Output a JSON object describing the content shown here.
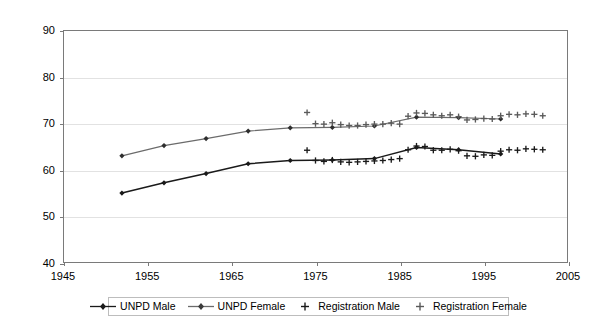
{
  "chart_data": {
    "type": "line",
    "title": "",
    "subtitle": "",
    "xlabel": "",
    "ylabel": "",
    "xlim": [
      1945,
      2005
    ],
    "ylim": [
      40,
      90
    ],
    "xticks": [
      1945,
      1955,
      1965,
      1975,
      1985,
      1995,
      2005
    ],
    "yticks": [
      40,
      50,
      60,
      70,
      80,
      90
    ],
    "grid": "horizontal",
    "legend_position": "bottom",
    "series": [
      {
        "name": "UNPD Male",
        "marker": "diamond",
        "style": "line-with-markers",
        "color": "#1a1a1a",
        "x": [
          1952,
          1957,
          1962,
          1967,
          1972,
          1977,
          1982,
          1987,
          1992,
          1997
        ],
        "values": [
          55.0,
          57.2,
          59.2,
          61.3,
          62.0,
          62.1,
          62.4,
          64.8,
          64.3,
          63.4
        ]
      },
      {
        "name": "UNPD Female",
        "marker": "diamond",
        "style": "line-with-markers",
        "color": "#6b6b6b",
        "x": [
          1952,
          1957,
          1962,
          1967,
          1972,
          1977,
          1982,
          1987,
          1992,
          1997
        ],
        "values": [
          63.0,
          65.2,
          66.7,
          68.3,
          69.0,
          69.1,
          69.4,
          71.3,
          71.2,
          70.9
        ]
      },
      {
        "name": "Registration Male",
        "marker": "plus",
        "style": "markers-only",
        "color": "#1a1a1a",
        "x": [
          1974,
          1975,
          1976,
          1977,
          1978,
          1979,
          1980,
          1981,
          1982,
          1983,
          1984,
          1985,
          1986,
          1987,
          1988,
          1989,
          1990,
          1991,
          1992,
          1993,
          1994,
          1995,
          1996,
          1997,
          1998,
          1999,
          2000,
          2001,
          2002
        ],
        "values": [
          64.2,
          62.0,
          61.8,
          62.1,
          61.7,
          61.6,
          61.7,
          61.8,
          61.9,
          62.0,
          62.2,
          62.4,
          64.3,
          65.1,
          65.0,
          64.2,
          64.2,
          64.4,
          64.1,
          63.0,
          62.9,
          63.2,
          63.1,
          64.0,
          64.3,
          64.2,
          64.5,
          64.4,
          64.3
        ]
      },
      {
        "name": "Registration Female",
        "marker": "plus",
        "style": "markers-only",
        "color": "#5a5a5a",
        "x": [
          1974,
          1975,
          1976,
          1977,
          1978,
          1979,
          1980,
          1981,
          1982,
          1983,
          1984,
          1985,
          1986,
          1987,
          1988,
          1989,
          1990,
          1991,
          1992,
          1993,
          1994,
          1995,
          1996,
          1997,
          1998,
          1999,
          2000,
          2001,
          2002
        ],
        "values": [
          72.3,
          69.9,
          69.8,
          70.1,
          69.7,
          69.5,
          69.5,
          69.7,
          69.8,
          69.8,
          70.0,
          69.8,
          71.5,
          72.2,
          72.1,
          71.8,
          71.6,
          71.8,
          71.4,
          70.7,
          70.8,
          71.0,
          70.9,
          71.6,
          71.9,
          71.8,
          72.0,
          71.9,
          71.6
        ]
      }
    ]
  },
  "legend": {
    "items": [
      {
        "label": "UNPD Male",
        "marker": "line-diamond",
        "color": "#1a1a1a"
      },
      {
        "label": "UNPD Female",
        "marker": "line-diamond",
        "color": "#6b6b6b"
      },
      {
        "label": "Registration Male",
        "marker": "plus",
        "color": "#1a1a1a"
      },
      {
        "label": "Registration Female",
        "marker": "plus",
        "color": "#5a5a5a"
      }
    ]
  },
  "axes": {
    "y_tick_labels": [
      "90",
      "80",
      "70",
      "60",
      "50",
      "40"
    ],
    "x_tick_labels": [
      "1945",
      "1955",
      "1965",
      "1975",
      "1985",
      "1995",
      "2005"
    ]
  },
  "colors": {
    "frame": "#7a7a7a",
    "grid": "#e2e2e2",
    "background": "#ffffff",
    "male": "#1a1a1a",
    "female": "#6b6b6b"
  }
}
